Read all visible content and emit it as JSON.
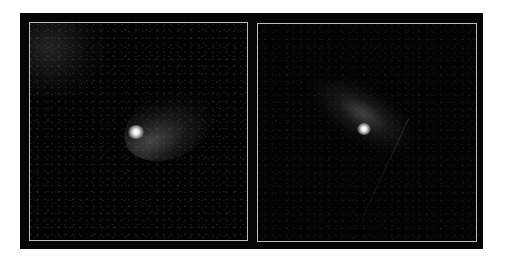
{
  "figure": {
    "background_color": "#050505",
    "frame_border_color": "#bdbdbd",
    "panels": [
      {
        "id": "left",
        "subject": "comet with diffuse coma",
        "nucleus_position_pct": [
          49,
          51
        ],
        "tail_direction": "upper-right",
        "corner_haze": "upper-left"
      },
      {
        "id": "right",
        "subject": "comet with elongated coma",
        "nucleus_position_pct": [
          48,
          49
        ],
        "tail_direction": "upper-left",
        "faint_streak": "lower-right"
      }
    ]
  }
}
